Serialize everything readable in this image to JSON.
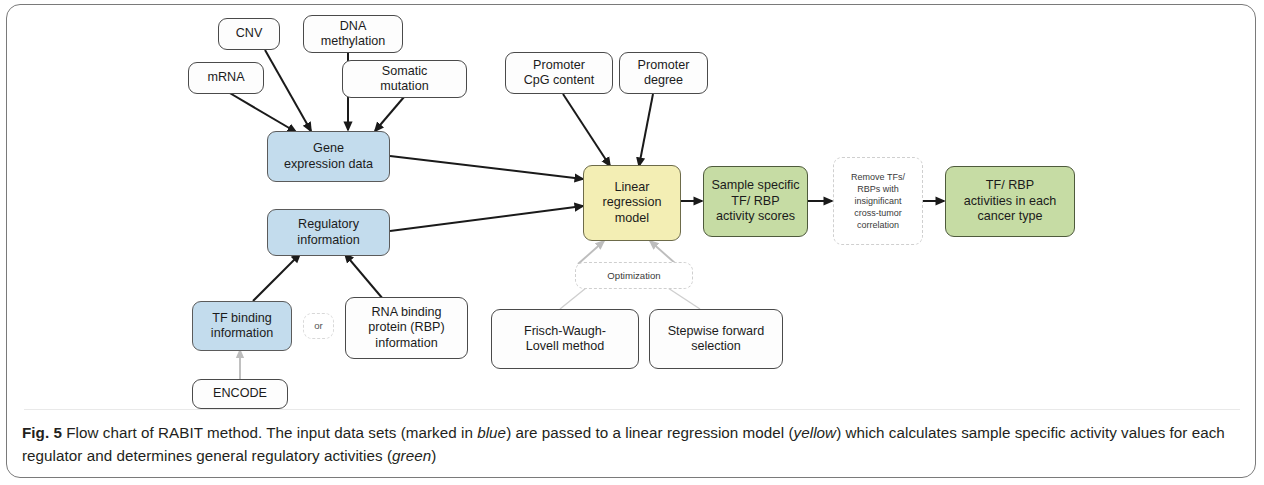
{
  "figure": {
    "label": "Fig. 5",
    "caption_part1": " Flow chart of RABIT method. The input data sets (marked in ",
    "caption_em1": "blue",
    "caption_part2": ") are passed to a linear regression model (",
    "caption_em2": "yellow",
    "caption_part3": ") which calculates sample specific activity values for each regulator and determines general regulatory activities (",
    "caption_em3": "green",
    "caption_part4": ")"
  },
  "colors": {
    "blue_fill": "#c3dced",
    "yellow_fill": "#f3eeb4",
    "green_fill": "#c6dca4",
    "white_fill": "#fdfdfd",
    "border": "#4a4a4a",
    "dashed_border": "#cfcfcf",
    "arrow_dark": "#1a1a1a",
    "arrow_light": "#bdbdbd",
    "frame": "#7a7a7a"
  },
  "nodes": {
    "cnv": {
      "label": "CNV",
      "type": "input",
      "color": "white"
    },
    "dna_methylation": {
      "line1": "DNA",
      "line2": "methylation",
      "type": "input",
      "color": "white"
    },
    "mrna": {
      "label": "mRNA",
      "type": "input",
      "color": "white"
    },
    "somatic_mutation": {
      "line1": "Somatic",
      "line2": "mutation",
      "type": "input",
      "color": "white"
    },
    "gene_expression_data": {
      "line1": "Gene",
      "line2": "expression data",
      "type": "data",
      "color": "blue"
    },
    "regulatory_information": {
      "line1": "Regulatory",
      "line2": "information",
      "type": "data",
      "color": "blue"
    },
    "tf_binding_information": {
      "line1": "TF binding",
      "line2": "information",
      "type": "data",
      "color": "blue"
    },
    "or_connector": {
      "label": "or",
      "type": "connector",
      "color": "dashed"
    },
    "rna_binding_protein_information": {
      "line1": "RNA binding",
      "line2": "protein (RBP)",
      "line3": "information",
      "type": "input",
      "color": "white"
    },
    "encode": {
      "label": "ENCODE",
      "type": "source",
      "color": "white"
    },
    "promoter_cpg_content": {
      "line1": "Promoter",
      "line2": "CpG content",
      "type": "input",
      "color": "white"
    },
    "promoter_degree": {
      "line1": "Promoter",
      "line2": "degree",
      "type": "input",
      "color": "white"
    },
    "linear_regression_model": {
      "line1": "Linear",
      "line2": "regression",
      "line3": "model",
      "type": "model",
      "color": "yellow"
    },
    "sample_specific_scores": {
      "line1": "Sample specific",
      "line2": "TF/ RBP",
      "line3": "activity scores",
      "type": "output",
      "color": "green"
    },
    "remove_tfs_rbps": {
      "line1": "Remove TFs/",
      "line2": "RBPs with",
      "line3": "insignificant",
      "line4": "cross-tumor",
      "line5": "correlation",
      "type": "filter",
      "color": "dashed"
    },
    "tf_rbp_activities": {
      "line1": "TF/ RBP",
      "line2": "activities in each",
      "line3": "cancer type",
      "type": "output",
      "color": "green"
    },
    "optimization": {
      "label": "Optimization",
      "type": "group",
      "color": "dashed"
    },
    "frisch_waugh_lovell": {
      "line1": "Frisch-Waugh-",
      "line2": "Lovell method",
      "type": "method",
      "color": "white"
    },
    "stepwise_forward_selection": {
      "line1": "Stepwise forward",
      "line2": "selection",
      "type": "method",
      "color": "white"
    }
  },
  "edges": [
    {
      "from": "cnv",
      "to": "gene_expression_data",
      "style": "solid-dark"
    },
    {
      "from": "dna_methylation",
      "to": "gene_expression_data",
      "style": "solid-dark"
    },
    {
      "from": "mrna",
      "to": "gene_expression_data",
      "style": "solid-dark"
    },
    {
      "from": "somatic_mutation",
      "to": "gene_expression_data",
      "style": "solid-dark"
    },
    {
      "from": "gene_expression_data",
      "to": "linear_regression_model",
      "style": "solid-dark"
    },
    {
      "from": "regulatory_information",
      "to": "linear_regression_model",
      "style": "solid-dark"
    },
    {
      "from": "tf_binding_information",
      "to": "regulatory_information",
      "style": "solid-dark"
    },
    {
      "from": "rna_binding_protein_information",
      "to": "regulatory_information",
      "style": "solid-dark"
    },
    {
      "from": "encode",
      "to": "tf_binding_information",
      "style": "solid-light"
    },
    {
      "from": "promoter_cpg_content",
      "to": "linear_regression_model",
      "style": "solid-dark"
    },
    {
      "from": "promoter_degree",
      "to": "linear_regression_model",
      "style": "solid-dark"
    },
    {
      "from": "linear_regression_model",
      "to": "sample_specific_scores",
      "style": "solid-dark"
    },
    {
      "from": "sample_specific_scores",
      "to": "remove_tfs_rbps",
      "style": "solid-dark"
    },
    {
      "from": "remove_tfs_rbps",
      "to": "tf_rbp_activities",
      "style": "solid-dark"
    },
    {
      "from": "frisch_waugh_lovell",
      "to": "linear_regression_model",
      "style": "solid-light"
    },
    {
      "from": "stepwise_forward_selection",
      "to": "linear_regression_model",
      "style": "solid-light"
    }
  ]
}
